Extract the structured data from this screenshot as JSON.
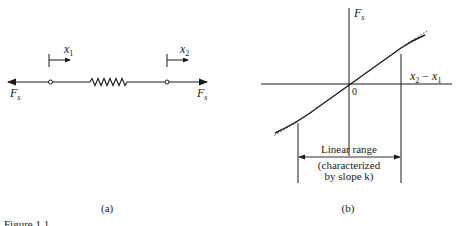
{
  "figure_a": {
    "force_left": "F",
    "force_left_sub": "s",
    "force_right": "F",
    "force_right_sub": "s",
    "pos1_label": "x",
    "pos1_sub": "1",
    "pos2_label": "x",
    "pos2_sub": "2",
    "caption": "(a)"
  },
  "figure_b": {
    "y_axis_label": "F",
    "y_axis_sub": "s",
    "x_axis_label_a": "x",
    "x_axis_sub_a": "2",
    "x_axis_minus": " − ",
    "x_axis_label_b": "x",
    "x_axis_sub_b": "1",
    "origin_label": "0",
    "range_label": "Linear range",
    "range_note_1": "(characterized",
    "range_note_2": "by slope k)",
    "caption": "(b)"
  },
  "footer": {
    "figure_label": "Figure 1.1"
  }
}
